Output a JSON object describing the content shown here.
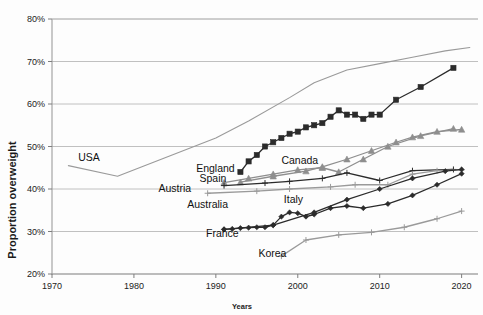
{
  "chart_data": {
    "type": "line",
    "title": "",
    "xlabel": "Years",
    "ylabel": "Proportion overweight",
    "xlim": [
      1970,
      2022
    ],
    "ylim": [
      20,
      80
    ],
    "xticks": [
      "1970",
      "1980",
      "1990",
      "2000",
      "2010",
      "2020"
    ],
    "xtick_values": [
      1970,
      1980,
      1990,
      2000,
      2010,
      2020
    ],
    "yticks": [
      "20%",
      "30%",
      "40%",
      "50%",
      "60%",
      "70%",
      "80%"
    ],
    "ytick_values": [
      20,
      30,
      40,
      50,
      60,
      70,
      80
    ],
    "grid": true,
    "legend": "inline-labels",
    "series": [
      {
        "name": "USA",
        "color": "#9a9a9a",
        "marker": "none",
        "label_x": 1973.2,
        "label_y": 46.6,
        "x": [
          1972,
          1978,
          1990,
          1994,
          1999,
          2002,
          2006,
          2010,
          2014,
          2018,
          2021
        ],
        "y": [
          45.5,
          43.0,
          52.0,
          56.0,
          61.5,
          65.0,
          68.0,
          69.5,
          71.0,
          72.5,
          73.3
        ]
      },
      {
        "name": "England",
        "color": "#2b2b2b",
        "marker": "square",
        "label_x": 1987.6,
        "label_y": 44.0,
        "x": [
          1993,
          1994,
          1995,
          1996,
          1997,
          1998,
          1999,
          2000,
          2001,
          2002,
          2003,
          2004,
          2005,
          2006,
          2007,
          2008,
          2009,
          2010,
          2012,
          2015,
          2019
        ],
        "y": [
          44.0,
          46.5,
          48.0,
          50.0,
          51.0,
          52.0,
          53.0,
          53.5,
          54.5,
          55.0,
          55.5,
          57.0,
          58.5,
          57.5,
          57.5,
          56.5,
          57.5,
          57.5,
          61.0,
          64.0,
          68.5
        ]
      },
      {
        "name": "Canada",
        "color": "#8e8e8e",
        "marker": "triangle",
        "label_x": 1998.0,
        "label_y": 46.0,
        "x": [
          1991,
          1994,
          1997,
          2000,
          2003,
          2005,
          2008,
          2011,
          2015,
          2019
        ],
        "y": [
          41.5,
          42.5,
          43.5,
          44.5,
          45.0,
          44.0,
          47.0,
          50.0,
          52.5,
          54.2
        ]
      },
      {
        "name": "Spain",
        "color": "#8e8e8e",
        "marker": "triangle",
        "label_x": 1988.0,
        "label_y": 41.6,
        "x": [
          1993,
          1997,
          2001,
          2003,
          2006,
          2009,
          2012,
          2014,
          2017,
          2020
        ],
        "y": [
          41.6,
          43.0,
          44.2,
          45.2,
          47.0,
          49.0,
          51.0,
          52.2,
          53.5,
          54.0
        ]
      },
      {
        "name": "Austria",
        "color": "#2b2b2b",
        "marker": "cross",
        "label_x": 1983.0,
        "label_y": 39.3,
        "x": [
          1991,
          1996,
          1999,
          2003,
          2006,
          2010,
          2014,
          2019
        ],
        "y": [
          40.8,
          41.4,
          41.8,
          42.5,
          43.8,
          42.0,
          44.3,
          44.6
        ]
      },
      {
        "name": "Australia",
        "color": "#9a9a9a",
        "marker": "cross",
        "label_x": 1986.5,
        "label_y": 35.5,
        "x": [
          1989,
          1995,
          1999,
          2004,
          2007,
          2011,
          2014,
          2017,
          2020
        ],
        "y": [
          39.0,
          39.5,
          40.0,
          40.5,
          41.0,
          41.0,
          43.5,
          44.3,
          44.5
        ]
      },
      {
        "name": "Italy",
        "color": "#2b2b2b",
        "marker": "diamond",
        "label_x": 1998.3,
        "label_y": 36.8,
        "x": [
          1991,
          1992,
          1993,
          1994,
          1995,
          1996,
          1997,
          1998,
          1999,
          2000,
          2001,
          2002,
          2004,
          2006,
          2008,
          2011,
          2014,
          2017,
          2020
        ],
        "y": [
          30.5,
          30.6,
          30.8,
          30.9,
          31.0,
          31.0,
          31.5,
          33.5,
          34.5,
          34.3,
          33.5,
          34.0,
          35.5,
          36.0,
          35.5,
          36.5,
          38.5,
          41.0,
          43.6
        ]
      },
      {
        "name": "France",
        "color": "#2b2b2b",
        "marker": "diamond",
        "label_x": 1988.8,
        "label_y": 28.7,
        "x": [
          1991,
          1997,
          2002,
          2006,
          2010,
          2014,
          2018,
          2020
        ],
        "y": [
          30.5,
          31.5,
          34.5,
          37.5,
          40.0,
          42.5,
          44.2,
          44.6
        ]
      },
      {
        "name": "Korea",
        "color": "#9a9a9a",
        "marker": "cross",
        "label_x": 1995.2,
        "label_y": 24.1,
        "x": [
          1998,
          2001,
          2005,
          2009,
          2013,
          2017,
          2020
        ],
        "y": [
          24.2,
          28.0,
          29.2,
          29.8,
          31.0,
          33.0,
          34.8
        ]
      }
    ]
  }
}
